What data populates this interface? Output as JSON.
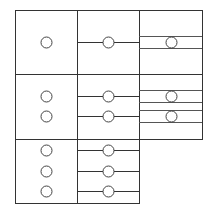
{
  "diagram": {
    "width": 214,
    "height": 211,
    "stroke_color": "#333333",
    "background": "#ffffff",
    "circle_radius": 5.5,
    "columns": [
      {
        "id": "col-1",
        "x0": 15,
        "x1": 77
      },
      {
        "id": "col-2",
        "x0": 77,
        "x1": 139
      },
      {
        "id": "col-3",
        "x0": 139,
        "x1": 202
      }
    ],
    "rows": [
      {
        "id": "row-1",
        "y0": 10,
        "y1": 74
      },
      {
        "id": "row-2",
        "y0": 74,
        "y1": 139
      },
      {
        "id": "row-3",
        "y0": 139,
        "y1": 203
      }
    ],
    "cells": [
      {
        "name": "cell-r1-c1",
        "x": 15,
        "y": 10,
        "w": 62,
        "h": 64,
        "nodes": [
          {
            "cx": 46,
            "cy": 42
          }
        ],
        "style": "plain"
      },
      {
        "name": "cell-r1-c2",
        "x": 77,
        "y": 10,
        "w": 62,
        "h": 64,
        "nodes": [
          {
            "cx": 108,
            "cy": 42
          }
        ],
        "style": "single-wire"
      },
      {
        "name": "cell-r1-c3",
        "x": 139,
        "y": 10,
        "w": 63,
        "h": 64,
        "nodes": [
          {
            "cx": 171,
            "cy": 42
          }
        ],
        "style": "double-rail"
      },
      {
        "name": "cell-r2-c1",
        "x": 15,
        "y": 74,
        "w": 62,
        "h": 65,
        "nodes": [
          {
            "cx": 46,
            "cy": 96
          },
          {
            "cx": 46,
            "cy": 116
          }
        ],
        "style": "plain"
      },
      {
        "name": "cell-r2-c2",
        "x": 77,
        "y": 74,
        "w": 62,
        "h": 65,
        "nodes": [
          {
            "cx": 108,
            "cy": 96
          },
          {
            "cx": 108,
            "cy": 116
          }
        ],
        "style": "single-wire"
      },
      {
        "name": "cell-r2-c3",
        "x": 139,
        "y": 74,
        "w": 63,
        "h": 65,
        "nodes": [
          {
            "cx": 171,
            "cy": 96
          },
          {
            "cx": 171,
            "cy": 116
          }
        ],
        "style": "double-rail"
      },
      {
        "name": "cell-r3-c1",
        "x": 15,
        "y": 139,
        "w": 62,
        "h": 64,
        "nodes": [
          {
            "cx": 46,
            "cy": 150
          },
          {
            "cx": 46,
            "cy": 171
          },
          {
            "cx": 46,
            "cy": 191
          }
        ],
        "style": "plain"
      },
      {
        "name": "cell-r3-c2",
        "x": 77,
        "y": 139,
        "w": 62,
        "h": 64,
        "nodes": [
          {
            "cx": 108,
            "cy": 150
          },
          {
            "cx": 108,
            "cy": 171
          },
          {
            "cx": 108,
            "cy": 191
          }
        ],
        "style": "single-wire"
      }
    ],
    "rail_half_gap": 6
  }
}
